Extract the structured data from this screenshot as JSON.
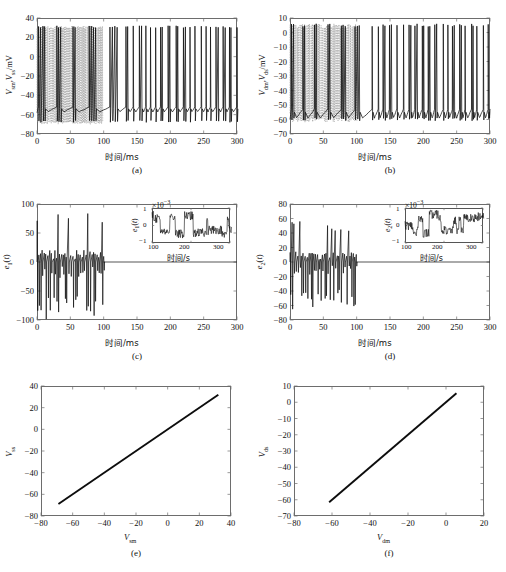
{
  "figure": {
    "panels": [
      {
        "id": "a",
        "caption": "(a)",
        "ylabel_html": "V<sub>sm</sub>, V<sub>ss</sub>/mV",
        "xlabel": "时间/ms",
        "ylim": [
          -80,
          40
        ],
        "xlim": [
          0,
          300
        ],
        "yticks": [
          -80,
          -60,
          -40,
          -20,
          0,
          20,
          40
        ],
        "xticks": [
          0,
          50,
          100,
          150,
          200,
          250,
          300
        ]
      },
      {
        "id": "b",
        "caption": "(b)",
        "ylabel_html": "V<sub>dm</sub>, V<sub>ds</sub>/mV",
        "xlabel": "时间/ms",
        "ylim": [
          -70,
          10
        ],
        "xlim": [
          0,
          300
        ],
        "yticks": [
          -70,
          -60,
          -50,
          -40,
          -30,
          -20,
          -10,
          0,
          10
        ],
        "xticks": [
          0,
          50,
          100,
          150,
          200,
          250,
          300
        ]
      },
      {
        "id": "c",
        "caption": "(c)",
        "ylabel_html": "e<sub>1</sub>(t)",
        "xlabel": "时间/ms",
        "ylim": [
          -100,
          100
        ],
        "xlim": [
          0,
          300
        ],
        "yticks": [
          -100,
          -50,
          0,
          50,
          100
        ],
        "xticks": [
          0,
          50,
          100,
          150,
          200,
          250,
          300
        ],
        "inset": {
          "ylabel_html": "e<sub>1</sub>(t)",
          "xlabel": "时间/s",
          "multiplier": "×10",
          "multiplier_exp": "-3",
          "ylim": [
            -1,
            1
          ],
          "xlim": [
            100,
            300
          ],
          "yticks": [
            -1,
            0,
            1
          ],
          "xticks": [
            100,
            200,
            300
          ]
        }
      },
      {
        "id": "d",
        "caption": "(d)",
        "ylabel_html": "e<sub>2</sub>(t)",
        "xlabel": "时间/ms",
        "ylim": [
          -80,
          80
        ],
        "xlim": [
          0,
          300
        ],
        "yticks": [
          -80,
          -60,
          -40,
          -20,
          0,
          20,
          40,
          60,
          80
        ],
        "xticks": [
          0,
          50,
          100,
          150,
          200,
          250,
          300
        ],
        "inset": {
          "ylabel_html": "e<sub>2</sub>(t)",
          "xlabel": "时间/s",
          "multiplier": "×10",
          "multiplier_exp": "-3",
          "ylim": [
            -1,
            1
          ],
          "xlim": [
            100,
            300
          ],
          "yticks": [
            -1,
            0,
            1
          ],
          "xticks": [
            100,
            200,
            300
          ]
        }
      },
      {
        "id": "e",
        "caption": "(e)",
        "ylabel_html": "V<sub>ss</sub>",
        "xlabel_html": "V<sub>sm</sub>",
        "ylim": [
          -80,
          40
        ],
        "xlim": [
          -80,
          40
        ],
        "yticks": [
          -80,
          -60,
          -40,
          -20,
          0,
          20,
          40
        ],
        "xticks": [
          -80,
          -60,
          -40,
          -20,
          0,
          20,
          40
        ],
        "line": {
          "x0": -69,
          "y0": -69,
          "x1": 32,
          "y1": 32
        }
      },
      {
        "id": "f",
        "caption": "(f)",
        "ylabel_html": "V<sub>ds</sub>",
        "xlabel_html": "V<sub>dm</sub>",
        "ylim": [
          -70,
          10
        ],
        "xlim": [
          -80,
          20
        ],
        "yticks": [
          -70,
          -60,
          -50,
          -40,
          -30,
          -20,
          -10,
          0,
          10
        ],
        "xticks": [
          -80,
          -60,
          -40,
          -20,
          0,
          20
        ],
        "line": {
          "x0": -61.5,
          "y0": -61.5,
          "x1": 5.5,
          "y1": 5.5
        }
      }
    ]
  },
  "chart_data": [
    {
      "type": "line",
      "panel": "a",
      "title": "",
      "xlabel": "时间/ms",
      "ylabel": "Vsm, Vss/mV",
      "xlim": [
        0,
        300
      ],
      "ylim": [
        -80,
        40
      ],
      "grid": false,
      "series": [
        {
          "name": "V_sm (master soma)",
          "style": "solid-black",
          "description": "Bursting spike train, resting baseline rising from -58 to -52 mV between bursts, spikes peaking near +32 mV, troughs to -68 mV; spike density increases after t=100 ms",
          "spike_peak": 32,
          "spike_trough": -68,
          "baseline": -55
        },
        {
          "name": "V_ss (slave soma)",
          "style": "dashed-gray",
          "description": "Unsynchronised dense spiking for t<100 ms then merges with master trace (synchronisation achieved)",
          "spike_peak": 32,
          "spike_trough": -70,
          "sync_time": 100
        }
      ]
    },
    {
      "type": "line",
      "panel": "b",
      "title": "",
      "xlabel": "时间/ms",
      "ylabel": "Vdm, Vds/mV",
      "xlim": [
        0,
        300
      ],
      "ylim": [
        -70,
        10
      ],
      "grid": false,
      "series": [
        {
          "name": "V_dm (master dendrite)",
          "style": "solid-black",
          "description": "Bursting dendritic potential, spikes peak near +6 mV, baseline between -60 and -52 mV",
          "spike_peak": 6,
          "spike_trough": -61,
          "baseline": -56
        },
        {
          "name": "V_ds (slave dendrite)",
          "style": "dashed-gray",
          "description": "Dense unsynchronised spiking before t=100 ms, synchronised thereafter",
          "spike_peak": 6,
          "spike_trough": -62,
          "sync_time": 100
        }
      ]
    },
    {
      "type": "line",
      "panel": "c",
      "title": "",
      "xlabel": "时间/ms",
      "ylabel": "e1(t)",
      "xlim": [
        0,
        300
      ],
      "ylim": [
        -100,
        100
      ],
      "grid": false,
      "series": [
        {
          "name": "e1(t) soma synchronisation error",
          "style": "solid-black",
          "description": "Large oscillating error for t<100 ms with positive excursions to +90 and negative to -100, decaying to ~0 after t=100 ms",
          "max": 90,
          "min": -100,
          "settle_time": 100,
          "steady_state": 0
        }
      ],
      "inset": {
        "type": "line",
        "xlabel": "时间/s",
        "ylabel": "e1(t)",
        "xlim": [
          100,
          300
        ],
        "ylim": [
          -1,
          1
        ],
        "y_multiplier": 0.001,
        "description": "Residual error bounded within ±1×10^-3, square-wave-like bounded fluctuation"
      }
    },
    {
      "type": "line",
      "panel": "d",
      "title": "",
      "xlabel": "时间/ms",
      "ylabel": "e2(t)",
      "xlim": [
        0,
        300
      ],
      "ylim": [
        -80,
        80
      ],
      "grid": false,
      "series": [
        {
          "name": "e2(t) dendrite synchronisation error",
          "style": "solid-black",
          "description": "Large oscillating error for t<100 ms with peaks to +61 and troughs to -66, decaying to ~0 after t=100 ms",
          "max": 61,
          "min": -66,
          "settle_time": 100,
          "steady_state": 0
        }
      ],
      "inset": {
        "type": "line",
        "xlabel": "时间/s",
        "ylabel": "e2(t)",
        "xlim": [
          100,
          300
        ],
        "ylim": [
          -1,
          1
        ],
        "y_multiplier": 0.001,
        "description": "Residual error bounded within ±1×10^-3"
      }
    },
    {
      "type": "scatter",
      "panel": "e",
      "title": "",
      "xlabel": "Vsm",
      "ylabel": "Vss",
      "xlim": [
        -80,
        40
      ],
      "ylim": [
        -80,
        40
      ],
      "grid": false,
      "series": [
        {
          "name": "V_ss vs V_sm",
          "style": "solid-black-thick",
          "description": "Straight 45-degree synchronisation manifold line from (-69,-69) to (32,32)",
          "x": [
            -69,
            32
          ],
          "y": [
            -69,
            32
          ],
          "slope": 1,
          "intercept": 0
        }
      ]
    },
    {
      "type": "scatter",
      "panel": "f",
      "title": "",
      "xlabel": "Vdm",
      "ylabel": "Vds",
      "xlim": [
        -80,
        20
      ],
      "ylim": [
        -70,
        10
      ],
      "grid": false,
      "series": [
        {
          "name": "V_ds vs V_dm",
          "style": "solid-black-thick",
          "description": "Straight 45-degree synchronisation manifold line from (-61.5,-61.5) to (5.5,5.5)",
          "x": [
            -61.5,
            5.5
          ],
          "y": [
            -61.5,
            5.5
          ],
          "slope": 1,
          "intercept": 0
        }
      ]
    }
  ]
}
